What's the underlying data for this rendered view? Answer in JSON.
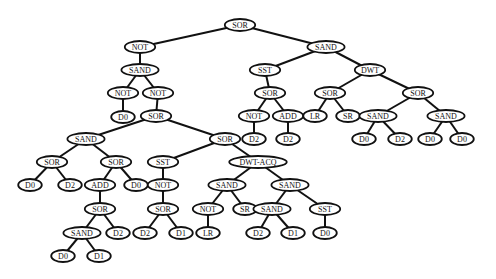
{
  "diagram": {
    "type": "tree",
    "colors": {
      "line": "#111111",
      "node_fill": "#ffffff",
      "background": "#ffffff"
    },
    "nodes": [
      {
        "id": "n0",
        "label": "SOR",
        "x": 240,
        "y": 25,
        "parent": null
      },
      {
        "id": "n1",
        "label": "NOT",
        "x": 140,
        "y": 47,
        "parent": "n0"
      },
      {
        "id": "n2",
        "label": "SAND",
        "x": 140,
        "y": 70,
        "parent": "n1"
      },
      {
        "id": "n3",
        "label": "NOT",
        "x": 123,
        "y": 93,
        "parent": "n2"
      },
      {
        "id": "n4",
        "label": "D0",
        "x": 123,
        "y": 117,
        "parent": "n3"
      },
      {
        "id": "n5",
        "label": "NOT",
        "x": 158,
        "y": 93,
        "parent": "n2"
      },
      {
        "id": "n6",
        "label": "SOR",
        "x": 156,
        "y": 116,
        "parent": "n5"
      },
      {
        "id": "n7",
        "label": "SAND",
        "x": 86,
        "y": 139,
        "parent": "n6"
      },
      {
        "id": "n8",
        "label": "SOR",
        "x": 52,
        "y": 162,
        "parent": "n7"
      },
      {
        "id": "n9",
        "label": "D0",
        "x": 30,
        "y": 185,
        "parent": "n8"
      },
      {
        "id": "n10",
        "label": "D2",
        "x": 70,
        "y": 185,
        "parent": "n8"
      },
      {
        "id": "n11",
        "label": "SOR",
        "x": 116,
        "y": 162,
        "parent": "n7"
      },
      {
        "id": "n12",
        "label": "ADD",
        "x": 100,
        "y": 185,
        "parent": "n11"
      },
      {
        "id": "n13",
        "label": "D0",
        "x": 136,
        "y": 185,
        "parent": "n11"
      },
      {
        "id": "n14",
        "label": "SOR",
        "x": 100,
        "y": 209,
        "parent": "n12"
      },
      {
        "id": "n15",
        "label": "SAND",
        "x": 82,
        "y": 233,
        "parent": "n14"
      },
      {
        "id": "n16",
        "label": "D2",
        "x": 118,
        "y": 233,
        "parent": "n14"
      },
      {
        "id": "n17",
        "label": "D0",
        "x": 63,
        "y": 256,
        "parent": "n15"
      },
      {
        "id": "n18",
        "label": "D1",
        "x": 99,
        "y": 256,
        "parent": "n15"
      },
      {
        "id": "n19",
        "label": "SOR",
        "x": 225,
        "y": 139,
        "parent": "n6"
      },
      {
        "id": "n20",
        "label": "SST",
        "x": 163,
        "y": 162,
        "parent": "n19"
      },
      {
        "id": "n21",
        "label": "NOT",
        "x": 163,
        "y": 185,
        "parent": "n20"
      },
      {
        "id": "n22",
        "label": "SOR",
        "x": 163,
        "y": 209,
        "parent": "n21"
      },
      {
        "id": "n23",
        "label": "D2",
        "x": 145,
        "y": 233,
        "parent": "n22"
      },
      {
        "id": "n24",
        "label": "D1",
        "x": 181,
        "y": 233,
        "parent": "n22"
      },
      {
        "id": "n25",
        "label": "DWT-ACQ",
        "x": 258,
        "y": 162,
        "parent": "n19"
      },
      {
        "id": "n26",
        "label": "SAND",
        "x": 227,
        "y": 185,
        "parent": "n25"
      },
      {
        "id": "n27",
        "label": "NOT",
        "x": 208,
        "y": 209,
        "parent": "n26"
      },
      {
        "id": "n28",
        "label": "LR",
        "x": 208,
        "y": 233,
        "parent": "n27"
      },
      {
        "id": "n29",
        "label": "SR",
        "x": 245,
        "y": 209,
        "parent": "n26"
      },
      {
        "id": "n30",
        "label": "SAND",
        "x": 290,
        "y": 185,
        "parent": "n25"
      },
      {
        "id": "n31",
        "label": "SAND",
        "x": 272,
        "y": 209,
        "parent": "n30"
      },
      {
        "id": "n32",
        "label": "D2",
        "x": 258,
        "y": 233,
        "parent": "n31"
      },
      {
        "id": "n33",
        "label": "D1",
        "x": 293,
        "y": 233,
        "parent": "n31"
      },
      {
        "id": "n34",
        "label": "SST",
        "x": 325,
        "y": 209,
        "parent": "n30"
      },
      {
        "id": "n35",
        "label": "D0",
        "x": 325,
        "y": 233,
        "parent": "n34"
      },
      {
        "id": "n36",
        "label": "SAND",
        "x": 326,
        "y": 47,
        "parent": "n0"
      },
      {
        "id": "n37",
        "label": "SST",
        "x": 265,
        "y": 70,
        "parent": "n36"
      },
      {
        "id": "n38",
        "label": "SOR",
        "x": 270,
        "y": 93,
        "parent": "n37"
      },
      {
        "id": "n39",
        "label": "NOT",
        "x": 254,
        "y": 116,
        "parent": "n38"
      },
      {
        "id": "n40",
        "label": "D2",
        "x": 254,
        "y": 139,
        "parent": "n39"
      },
      {
        "id": "n41",
        "label": "ADD",
        "x": 288,
        "y": 116,
        "parent": "n38"
      },
      {
        "id": "n42",
        "label": "D2",
        "x": 288,
        "y": 139,
        "parent": "n41"
      },
      {
        "id": "n43",
        "label": "DWT",
        "x": 370,
        "y": 70,
        "parent": "n36"
      },
      {
        "id": "n44",
        "label": "SOR",
        "x": 330,
        "y": 93,
        "parent": "n43"
      },
      {
        "id": "n45",
        "label": "LR",
        "x": 315,
        "y": 116,
        "parent": "n44"
      },
      {
        "id": "n46",
        "label": "SR",
        "x": 348,
        "y": 116,
        "parent": "n44"
      },
      {
        "id": "n47",
        "label": "SOR",
        "x": 418,
        "y": 93,
        "parent": "n43"
      },
      {
        "id": "n48",
        "label": "SAND",
        "x": 378,
        "y": 116,
        "parent": "n47"
      },
      {
        "id": "n49",
        "label": "D0",
        "x": 364,
        "y": 139,
        "parent": "n48"
      },
      {
        "id": "n50",
        "label": "D2",
        "x": 400,
        "y": 139,
        "parent": "n48"
      },
      {
        "id": "n51",
        "label": "SAND",
        "x": 446,
        "y": 116,
        "parent": "n47"
      },
      {
        "id": "n52",
        "label": "D0",
        "x": 430,
        "y": 139,
        "parent": "n51"
      },
      {
        "id": "n53",
        "label": "D0",
        "x": 462,
        "y": 139,
        "parent": "n51"
      }
    ]
  }
}
